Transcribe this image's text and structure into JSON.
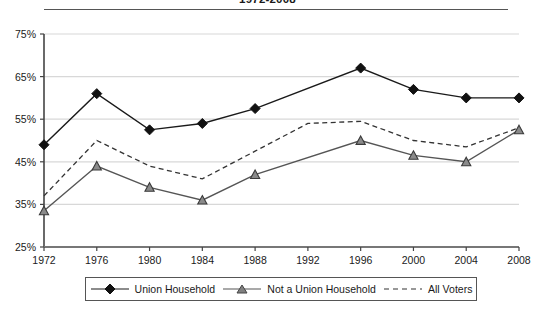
{
  "title": "1972-2008",
  "chart_data": {
    "type": "line",
    "title": "1972-2008",
    "xlabel": "",
    "ylabel": "",
    "ylim": [
      25,
      75
    ],
    "ytick_step": 10,
    "grid": true,
    "legend_position": "bottom",
    "categories": [
      "1972",
      "1976",
      "1980",
      "1984",
      "1988",
      "1992",
      "1996",
      "2000",
      "2004",
      "2008"
    ],
    "x": [
      1972,
      1976,
      1980,
      1984,
      1988,
      1992,
      1996,
      2000,
      2004,
      2008
    ],
    "ytick_labels": [
      "25%",
      "35%",
      "45%",
      "55%",
      "65%",
      "75%"
    ],
    "ytick_values": [
      25,
      35,
      45,
      55,
      65,
      75
    ],
    "series": [
      {
        "name": "Union Household",
        "marker": "diamond",
        "line_style": "solid",
        "color": "#1a1a1a",
        "values": [
          49,
          61,
          52.5,
          54,
          57.5,
          null,
          67,
          62,
          60,
          60
        ],
        "marker_years": [
          1972,
          1976,
          1980,
          1984,
          1988,
          1996,
          2000,
          2004,
          2008
        ]
      },
      {
        "name": "Not a Union Household",
        "marker": "triangle",
        "line_style": "solid",
        "color": "#555555",
        "values": [
          33.5,
          44,
          39,
          36,
          42,
          null,
          50,
          46.5,
          45,
          52.5
        ],
        "marker_years": [
          1972,
          1976,
          1980,
          1984,
          1988,
          1996,
          2000,
          2004,
          2008
        ]
      },
      {
        "name": "All Voters",
        "marker": "none",
        "line_style": "dashed",
        "color": "#333333",
        "values": [
          37,
          50,
          44,
          41,
          47.5,
          54,
          54.5,
          50,
          48.5,
          53
        ],
        "marker_years": []
      }
    ]
  },
  "legend": {
    "items": [
      {
        "label": "Union Household",
        "marker": "diamond",
        "style": "solid"
      },
      {
        "label": "Not a Union Household",
        "marker": "triangle",
        "style": "solid"
      },
      {
        "label": "All Voters",
        "marker": "none",
        "style": "dashed"
      }
    ]
  }
}
